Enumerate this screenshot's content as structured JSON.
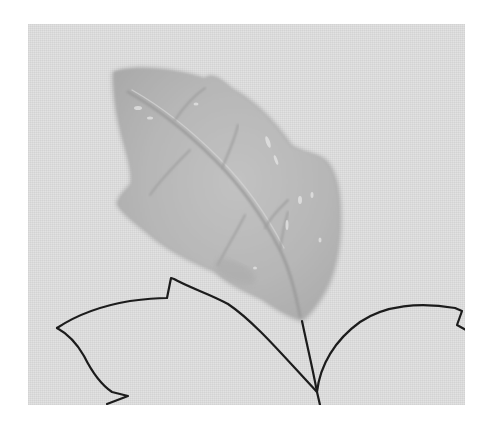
{
  "image": {
    "description": "Black-and-white photograph of a glossy molded leaf on textured fabric with hand-drawn black leaf outlines below",
    "alt": "Glossy molded leaf on fabric with drawn leaf outlines",
    "colors": {
      "page_background": "#ffffff",
      "fabric": "#e2e2e2",
      "leaf_fill": "#b9b9b9",
      "leaf_shadow": "#a6a6a6",
      "leaf_highlight": "#d8d8d8",
      "vein": "#9a9a9a",
      "outline_ink": "#1a1a1a"
    }
  }
}
